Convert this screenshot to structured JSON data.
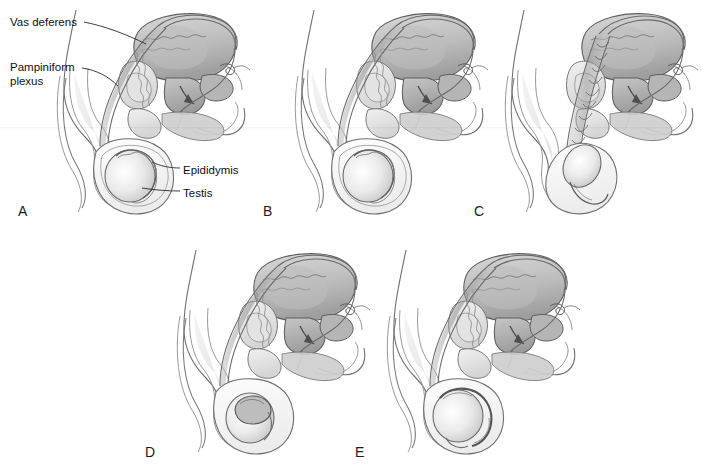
{
  "figure": {
    "background_color": "#ffffff",
    "ink_color": "#3a3a3a",
    "text_color": "#101010",
    "fill_light": "#e8e8e8",
    "fill_mid": "#c9c9c9",
    "fill_dark": "#a6a6a6"
  },
  "callouts": [
    {
      "id": "vas-deferens",
      "label": "Vas deferens",
      "x": 10,
      "y": 16,
      "lines": 1
    },
    {
      "id": "pampiniform-plexus",
      "label": "Pampiniform\nplexus",
      "x": 10,
      "y": 61,
      "lines": 2
    },
    {
      "id": "epididymis",
      "label": "Epididymis",
      "x": 183,
      "y": 164,
      "lines": 1
    },
    {
      "id": "testis",
      "label": "Testis",
      "x": 183,
      "y": 187,
      "lines": 1
    }
  ],
  "panels": [
    {
      "id": "panel-a",
      "letter": "A",
      "letter_x": 18,
      "letter_y": 203,
      "origin_x": 30,
      "origin_y": 6,
      "variant": "normal-labeled",
      "labeled": true,
      "cord_style": "straight",
      "testis_style": "normal"
    },
    {
      "id": "panel-b",
      "letter": "B",
      "letter_x": 263,
      "letter_y": 203,
      "origin_x": 268,
      "origin_y": 6,
      "variant": "normal",
      "labeled": false,
      "cord_style": "straight",
      "testis_style": "normal"
    },
    {
      "id": "panel-c",
      "letter": "C",
      "letter_x": 474,
      "letter_y": 203,
      "origin_x": 478,
      "origin_y": 6,
      "variant": "torsion-twisted-cord",
      "labeled": false,
      "cord_style": "twisted",
      "testis_style": "elevated-horizontal"
    },
    {
      "id": "panel-d",
      "letter": "D",
      "letter_x": 145,
      "letter_y": 444,
      "origin_x": 150,
      "origin_y": 246,
      "variant": "appendage-torsion",
      "labeled": false,
      "cord_style": "straight",
      "testis_style": "appendix-lesion"
    },
    {
      "id": "panel-e",
      "letter": "E",
      "letter_x": 355,
      "letter_y": 444,
      "origin_x": 360,
      "origin_y": 246,
      "variant": "epididymitis",
      "labeled": false,
      "cord_style": "straight",
      "testis_style": "enlarged-epididymis"
    }
  ]
}
